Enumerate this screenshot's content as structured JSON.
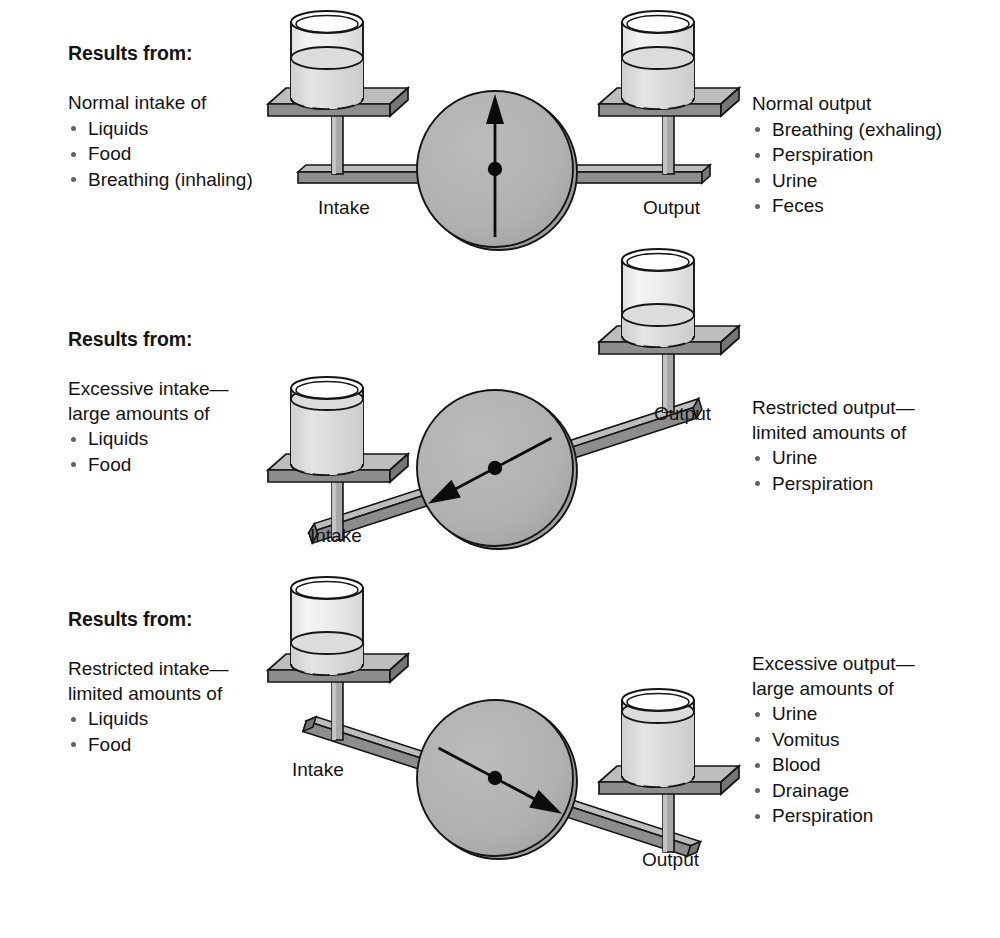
{
  "diagram": {
    "colors": {
      "ink": "#131313",
      "metal_top": "#b3b3b3",
      "metal_face": "#8d8d8d",
      "metal_edge": "#6f6f6f",
      "dial_fill": "#b0b0b0",
      "dial_rim": "#9a9a9a",
      "glass_fill": "#eceaea",
      "liquid_fill": "#d9d9d9",
      "bullet": "#636363",
      "background": "#ffffff"
    },
    "panels": [
      {
        "id": "balanced",
        "heading": "Results from:",
        "left": {
          "lead": "Normal intake of",
          "items": [
            "Liquids",
            "Food",
            "Breathing (inhaling)"
          ]
        },
        "right": {
          "lead": "Normal output",
          "items": [
            "Breathing (exhaling)",
            "Perspiration",
            "Urine",
            "Feces"
          ]
        },
        "scale": {
          "intake_label": "Intake",
          "output_label": "Output",
          "tilt_degrees": 0,
          "needle_direction": "up",
          "needle_angle_degrees": 0,
          "intake_fill_percent": 55,
          "output_fill_percent": 55,
          "state": "balanced"
        }
      },
      {
        "id": "intake-exceeds-output",
        "heading": "Results from:",
        "left": {
          "lead": "Excessive intake— large amounts of",
          "lead_line1": "Excessive intake—",
          "lead_line2": "large amounts of",
          "items": [
            "Liquids",
            "Food"
          ]
        },
        "right": {
          "lead": "Restricted output— limited amounts of",
          "lead_line1": "Restricted output—",
          "lead_line2": "limited amounts of",
          "items": [
            "Urine",
            "Perspiration"
          ]
        },
        "scale": {
          "intake_label": "Intake",
          "output_label": "Output",
          "tilt_degrees": -18,
          "needle_direction": "down-left",
          "needle_angle_degrees": -118,
          "intake_fill_percent": 88,
          "output_fill_percent": 30,
          "state": "tipped-toward-intake"
        }
      },
      {
        "id": "output-exceeds-intake",
        "heading": "Results from:",
        "left": {
          "lead": "Restricted intake— limited amounts of",
          "lead_line1": "Restricted intake—",
          "lead_line2": "limited amounts of",
          "items": [
            "Liquids",
            "Food"
          ]
        },
        "right": {
          "lead": "Excessive output— large amounts of",
          "lead_line1": "Excessive output—",
          "lead_line2": "large amounts of",
          "items": [
            "Urine",
            "Vomitus",
            "Blood",
            "Drainage",
            "Perspiration"
          ]
        },
        "scale": {
          "intake_label": "Intake",
          "output_label": "Output",
          "tilt_degrees": 18,
          "needle_direction": "down-right",
          "needle_angle_degrees": 118,
          "intake_fill_percent": 30,
          "output_fill_percent": 85,
          "state": "tipped-toward-output"
        }
      }
    ]
  }
}
